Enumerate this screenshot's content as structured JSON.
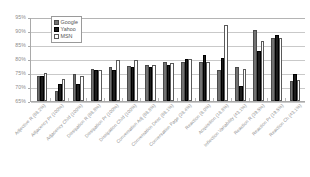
{
  "chart_data": {
    "type": "bar",
    "title": "",
    "subtitle": "",
    "xlabel": "",
    "ylabel": "",
    "ylim": [
      65,
      95
    ],
    "ytick_step": 5,
    "ytick_labels": [
      "95%",
      "90%",
      "85%",
      "80%",
      "75%",
      "70%",
      "65%"
    ],
    "ytick_values": [
      95,
      90,
      85,
      80,
      75,
      70,
      65
    ],
    "grid": true,
    "legend_position": "top-left-inside",
    "value_format": "percent",
    "categories": [
      "Adjective R (88.2%)",
      "Adjacency Pr (100%)",
      "Adjacency Ch/d (100%)",
      "Dissipation R (88.8%)",
      "Dissipation Pr (100%)",
      "Dissipation Ch/d (100%)",
      "Conversation Adj (88.8%)",
      "Conversation Desc (88.1%)",
      "Conversation Page (28.4%)",
      "Reaction (8.0%)",
      "Acquisition (18.8%)",
      "Inflection Variability (43.1%)",
      "Reaction R (39.5%)",
      "Reaction Pr (19.5%)",
      "Reaction Ch (43.1%)"
    ],
    "series": [
      {
        "name": "Google",
        "color": "#727272",
        "values": [
          74.0,
          68.5,
          74.5,
          76.5,
          77.0,
          77.5,
          78.0,
          79.0,
          79.0,
          79.0,
          76.0,
          77.0,
          90.5,
          87.5,
          72.0
        ]
      },
      {
        "name": "Yahoo",
        "color": "#1c1c1c",
        "values": [
          74.0,
          71.0,
          71.0,
          76.0,
          76.0,
          77.0,
          77.0,
          78.0,
          80.0,
          81.5,
          80.5,
          70.5,
          83.0,
          88.5,
          74.5
        ]
      },
      {
        "name": "MSN",
        "color": "#ffffff",
        "values": [
          75.0,
          73.0,
          74.0,
          76.0,
          79.5,
          79.5,
          78.0,
          78.5,
          80.0,
          79.0,
          92.0,
          76.5,
          86.5,
          87.5,
          72.5
        ]
      }
    ]
  },
  "legend": {
    "items": [
      {
        "label": "Google"
      },
      {
        "label": "Yahoo"
      },
      {
        "label": "MSN"
      }
    ]
  }
}
